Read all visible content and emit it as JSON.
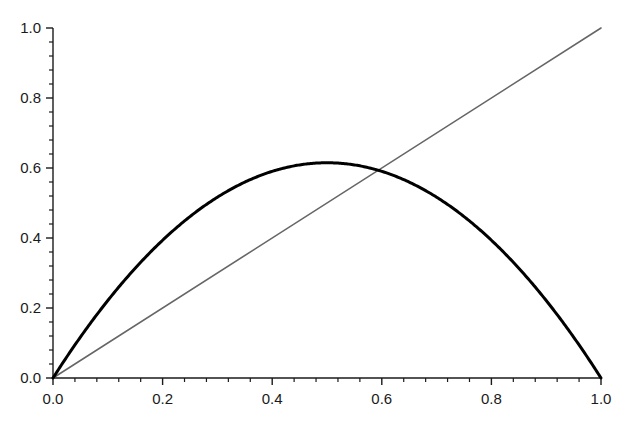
{
  "figure": {
    "background_color": "#ffffff",
    "width": 623,
    "height": 421
  },
  "chart_data": {
    "type": "line",
    "title": "",
    "subtitle": "",
    "xlabel": "",
    "ylabel": "",
    "xlim": [
      0.0,
      1.0
    ],
    "ylim": [
      0.0,
      1.0
    ],
    "grid": false,
    "legend": null,
    "annotations": [],
    "axes": {
      "x": {
        "major_ticks": [
          0.0,
          0.2,
          0.4,
          0.6,
          0.8,
          1.0
        ],
        "tick_labels": [
          "0.0",
          "0.2",
          "0.4",
          "0.6",
          "0.8",
          "1.0"
        ],
        "minor_tick_step": 0.04,
        "tick_direction": "out",
        "spine": "bottom"
      },
      "y": {
        "major_ticks": [
          0.0,
          0.2,
          0.4,
          0.6,
          0.8,
          1.0
        ],
        "tick_labels": [
          "0.0",
          "0.2",
          "0.4",
          "0.6",
          "0.8",
          "1.0"
        ],
        "minor_tick_step": 0.04,
        "tick_direction": "out",
        "spine": "left"
      }
    },
    "series": [
      {
        "name": "logistic-map-parabola",
        "type": "line",
        "color": "#000000",
        "linewidth": 3.0,
        "formula": "y = 4*r*x*(1-x)",
        "r": 0.615,
        "peak": {
          "x": 0.5,
          "y": 0.615
        },
        "x": [
          0.0,
          0.05,
          0.1,
          0.15,
          0.2,
          0.25,
          0.3,
          0.35,
          0.4,
          0.45,
          0.5,
          0.55,
          0.6,
          0.65,
          0.7,
          0.75,
          0.8,
          0.85,
          0.9,
          0.95,
          1.0
        ],
        "values": [
          0.0,
          0.117,
          0.221,
          0.314,
          0.394,
          0.461,
          0.517,
          0.56,
          0.59,
          0.609,
          0.615,
          0.609,
          0.59,
          0.56,
          0.517,
          0.461,
          0.394,
          0.314,
          0.221,
          0.117,
          0.0
        ]
      },
      {
        "name": "identity-line",
        "type": "line",
        "color": "#666666",
        "linewidth": 1.6,
        "formula": "y = x",
        "x": [
          0.0,
          1.0
        ],
        "values": [
          0.0,
          1.0
        ]
      }
    ],
    "intersections": [
      {
        "x": 0.0,
        "y": 0.0
      },
      {
        "x": 0.5935,
        "y": 0.5935
      }
    ]
  }
}
